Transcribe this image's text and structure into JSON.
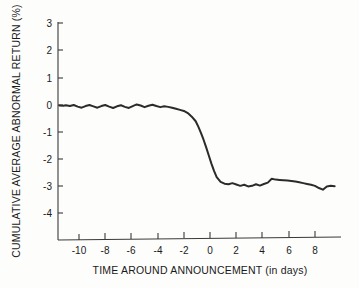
{
  "chart_data": {
    "type": "line",
    "title": "",
    "xlabel": "TIME AROUND ANNOUNCEMENT (in days)",
    "ylabel": "CUMULATIVE AVERAGE ABNORMAL RETURN (%)",
    "xlim": [
      -11.5,
      9.5
    ],
    "ylim": [
      -4.9,
      3.0
    ],
    "xticks": [
      -10,
      -8,
      -6,
      -4,
      -2,
      0,
      2,
      4,
      6,
      8
    ],
    "xtick_labels": [
      "-10",
      "-8",
      "-6",
      "-4",
      "-2",
      "0",
      "2",
      "4",
      "6",
      "8"
    ],
    "yticks": [
      3,
      2,
      1,
      0,
      -1,
      -2,
      -3,
      -4
    ],
    "ytick_labels": [
      "3",
      "2",
      "1",
      "0",
      "-1",
      "-2",
      "-3",
      "-4"
    ],
    "grid": false,
    "legend": null,
    "series": [
      {
        "name": "Cumulative average abnormal return",
        "color": "#2b2b2b",
        "x": [
          -11.5,
          -11.2,
          -11.0,
          -10.7,
          -10.4,
          -10.1,
          -9.8,
          -9.5,
          -9.2,
          -8.9,
          -8.6,
          -8.3,
          -8.0,
          -7.7,
          -7.4,
          -7.1,
          -6.8,
          -6.5,
          -6.2,
          -5.9,
          -5.6,
          -5.3,
          -5.0,
          -4.7,
          -4.4,
          -4.1,
          -3.8,
          -3.5,
          -3.2,
          -2.9,
          -2.6,
          -2.3,
          -2.0,
          -1.7,
          -1.4,
          -1.1,
          -0.9,
          -0.7,
          -0.5,
          -0.3,
          -0.1,
          0.1,
          0.3,
          0.5,
          0.8,
          1.1,
          1.4,
          1.7,
          2.0,
          2.3,
          2.6,
          2.9,
          3.2,
          3.5,
          3.8,
          4.1,
          4.4,
          4.7,
          5.0,
          5.3,
          5.6,
          5.9,
          6.2,
          6.5,
          6.8,
          7.1,
          7.4,
          7.7,
          8.0,
          8.3,
          8.6,
          8.9,
          9.2,
          9.5
        ],
        "y": [
          -0.04,
          -0.05,
          -0.03,
          -0.06,
          -0.02,
          -0.08,
          -0.12,
          -0.06,
          -0.02,
          -0.07,
          -0.12,
          -0.06,
          -0.02,
          -0.08,
          -0.13,
          -0.07,
          -0.03,
          -0.09,
          -0.13,
          -0.06,
          0.0,
          -0.04,
          -0.1,
          -0.05,
          -0.01,
          -0.06,
          -0.1,
          -0.07,
          -0.09,
          -0.12,
          -0.16,
          -0.2,
          -0.24,
          -0.32,
          -0.45,
          -0.62,
          -0.82,
          -1.05,
          -1.3,
          -1.58,
          -1.88,
          -2.18,
          -2.45,
          -2.68,
          -2.85,
          -2.92,
          -2.94,
          -2.9,
          -2.95,
          -3.0,
          -2.96,
          -3.02,
          -3.0,
          -2.94,
          -2.99,
          -2.93,
          -2.88,
          -2.74,
          -2.77,
          -2.78,
          -2.79,
          -2.8,
          -2.82,
          -2.84,
          -2.87,
          -2.9,
          -2.93,
          -2.96,
          -3.0,
          -3.08,
          -3.14,
          -3.02,
          -3.0,
          -3.01
        ]
      }
    ]
  },
  "axes": {
    "y_axis_title": "CUMULATIVE AVERAGE ABNORMAL RETURN (%)",
    "x_axis_title": "TIME AROUND ANNOUNCEMENT (in days)"
  },
  "colors": {
    "curve": "#2b2b2b",
    "axis": "#3a3a3a",
    "background": "#fdfdfc",
    "text": "#1a1a1a"
  }
}
